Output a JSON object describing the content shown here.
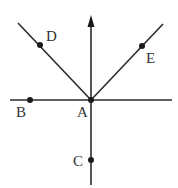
{
  "diagram": {
    "type": "geometry-rays",
    "colors": {
      "line": "#2b2b2b",
      "point": "#1a1a1a",
      "label": "#333333",
      "background": "#ffffff"
    },
    "points": [
      {
        "id": "A",
        "label": "A",
        "x": 91,
        "y": 100
      },
      {
        "id": "B",
        "label": "B",
        "x": 30,
        "y": 100
      },
      {
        "id": "C",
        "label": "C",
        "x": 91,
        "y": 160
      },
      {
        "id": "D",
        "label": "D",
        "x": 40,
        "y": 45
      },
      {
        "id": "E",
        "label": "E",
        "x": 142,
        "y": 46
      }
    ],
    "lines": [
      {
        "id": "horizontal-line",
        "from": [
          10,
          100
        ],
        "to": [
          172,
          100
        ]
      },
      {
        "id": "vertical-line",
        "from": [
          91,
          185
        ],
        "to": [
          91,
          20
        ],
        "arrow": "up"
      },
      {
        "id": "ray-AD",
        "from": [
          91,
          100
        ],
        "to": [
          18,
          23
        ]
      },
      {
        "id": "ray-AE",
        "from": [
          91,
          100
        ],
        "to": [
          163,
          24
        ]
      }
    ]
  }
}
